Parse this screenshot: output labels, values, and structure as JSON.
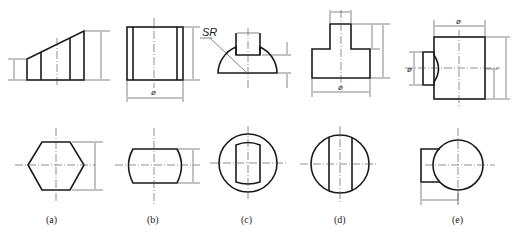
{
  "figure": {
    "views": [
      {
        "id": "a",
        "caption": "(a)",
        "front_view": "trapezoid-prism-sloped-top",
        "top_view": "hexagon"
      },
      {
        "id": "b",
        "caption": "(b)",
        "front_view": "rectangle-with-inner-lines",
        "top_view": "barrel-shaped-slot",
        "dimension_symbol": "ø"
      },
      {
        "id": "c",
        "caption": "(c)",
        "front_view": "hemisphere-with-slot",
        "top_view": "circle-with-rounded-slot",
        "dimension_label": "SR"
      },
      {
        "id": "d",
        "caption": "(d)",
        "front_view": "inverted-t-step",
        "top_view": "circle-with-two-chords",
        "dimension_symbol": "ø"
      },
      {
        "id": "e",
        "caption": "(e)",
        "front_view": "cylinder-with-side-boss",
        "top_view": "circle-with-side-block",
        "dimension_symbols": [
          "ø",
          "ø"
        ]
      }
    ],
    "colors": {
      "line": "#1a1a1a",
      "background": "#ffffff"
    }
  }
}
